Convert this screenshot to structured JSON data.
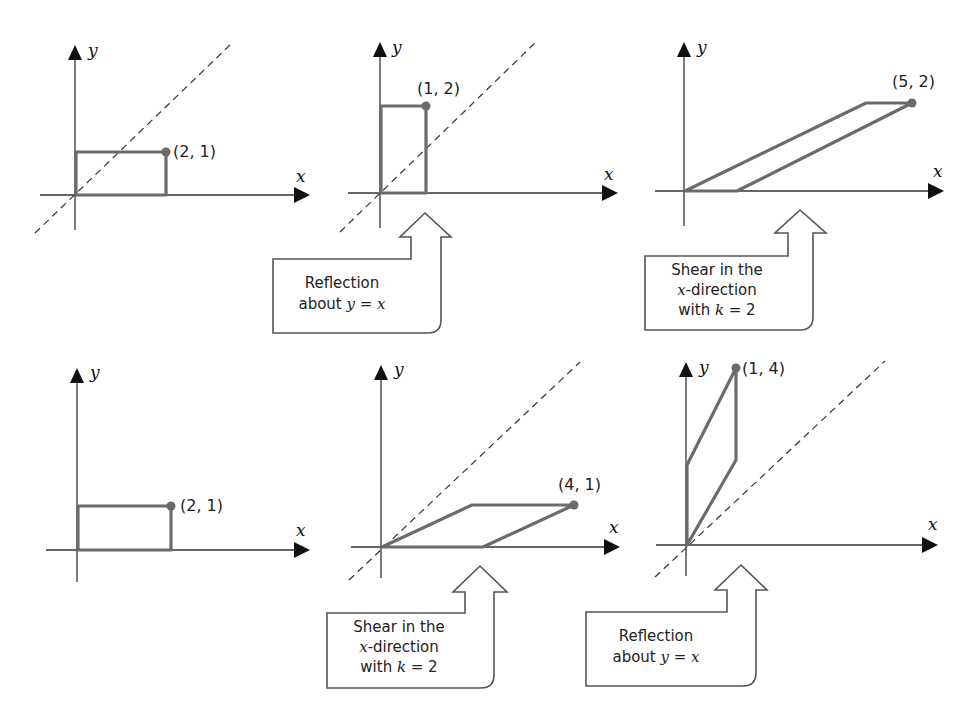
{
  "figure": {
    "axis_labels": {
      "x": "x",
      "y": "y"
    },
    "colors": {
      "shape": "#6b6b6b",
      "axis": "#333333",
      "arrowhead": "#111111",
      "callout_border": "#555555"
    },
    "panels": [
      {
        "id": "top-1",
        "shape": "rectangle",
        "point_label": "(2, 1)",
        "point": [
          2,
          1
        ],
        "has_line_y_eq_x": true
      },
      {
        "id": "top-2",
        "shape": "rectangle",
        "point_label": "(1, 2)",
        "point": [
          1,
          2
        ],
        "has_line_y_eq_x": true
      },
      {
        "id": "top-3",
        "shape": "parallelogram",
        "point_label": "(5, 2)",
        "point": [
          5,
          2
        ],
        "has_line_y_eq_x": false
      },
      {
        "id": "bottom-1",
        "shape": "rectangle",
        "point_label": "(2, 1)",
        "point": [
          2,
          1
        ],
        "has_line_y_eq_x": false
      },
      {
        "id": "bottom-2",
        "shape": "parallelogram",
        "point_label": "(4, 1)",
        "point": [
          4,
          1
        ],
        "has_line_y_eq_x": true
      },
      {
        "id": "bottom-3",
        "shape": "parallelogram",
        "point_label": "(1, 4)",
        "point": [
          1,
          4
        ],
        "has_line_y_eq_x": true
      }
    ],
    "callouts": [
      {
        "id": "top-reflection",
        "lines": [
          "Reflection",
          "about ",
          "y = x"
        ],
        "line1": "Reflection",
        "line2_prefix": "about ",
        "line2_math": "y = x"
      },
      {
        "id": "top-shear",
        "line1": "Shear in the",
        "line2_math": "x",
        "line2_suffix": "-direction",
        "line3_prefix": "with ",
        "line3_math": "k",
        "line3_suffix": " = 2"
      },
      {
        "id": "bottom-shear",
        "line1": "Shear in the",
        "line2_math": "x",
        "line2_suffix": "-direction",
        "line3_prefix": "with ",
        "line3_math": "k",
        "line3_suffix": " = 2"
      },
      {
        "id": "bottom-reflection",
        "line1": "Reflection",
        "line2_prefix": "about ",
        "line2_math": "y = x"
      }
    ]
  }
}
